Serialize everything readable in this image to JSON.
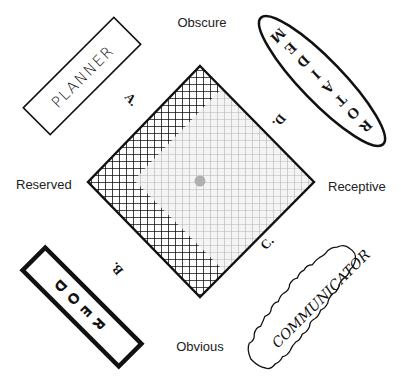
{
  "axes": {
    "top": "Obscure",
    "bottom": "Obvious",
    "left": "Reserved",
    "right": "Receptive"
  },
  "quadrants": {
    "a": "A.",
    "b": "B.",
    "c": "C.",
    "d": "D."
  },
  "roles": {
    "planner": "PLANNER",
    "mediator": [
      "M",
      "E",
      "D",
      "I",
      "A",
      "T",
      "O",
      "R"
    ],
    "doer": [
      "D",
      "O",
      "E",
      "R"
    ],
    "communicator": "COMMUNICATOR"
  },
  "colors": {
    "dark_grid": "#111111",
    "light_grid": "#b5b5b5",
    "center_dot": "#b0b0b0"
  }
}
